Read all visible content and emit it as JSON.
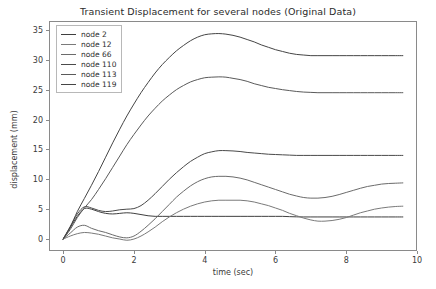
{
  "chart_data": {
    "type": "line",
    "title": "Transient Displacement for several nodes (Original Data)",
    "xlabel": "time (sec)",
    "ylabel": "displacement (mm)",
    "xlim": [
      -0.4,
      10.0
    ],
    "ylim": [
      -2.0,
      36.5
    ],
    "xticks": [
      0,
      2,
      4,
      6,
      8,
      10
    ],
    "xtick_labels": [
      "0",
      "2",
      "4",
      "6",
      "8",
      "10"
    ],
    "yticks": [
      0,
      5,
      10,
      15,
      20,
      25,
      30,
      35
    ],
    "ytick_labels": [
      "0",
      "5",
      "10",
      "15",
      "20",
      "25",
      "30",
      "35"
    ],
    "grid": false,
    "legend_position": "upper left",
    "x": [
      0,
      0.2,
      0.4,
      0.6,
      0.8,
      1.0,
      1.2,
      1.4,
      1.6,
      1.8,
      2.0,
      2.2,
      2.4,
      2.6,
      2.8,
      3.0,
      3.2,
      3.4,
      3.6,
      3.8,
      4.0,
      4.2,
      4.4,
      4.6,
      4.8,
      5.0,
      5.2,
      5.4,
      5.6,
      5.8,
      6.0,
      6.2,
      6.4,
      6.6,
      6.8,
      7.0,
      7.2,
      7.4,
      7.6,
      7.8,
      8.0,
      8.2,
      8.4,
      8.6,
      8.8,
      9.0,
      9.2,
      9.4,
      9.6
    ],
    "series": [
      {
        "name": "node 2",
        "color": "#3f3f3f",
        "values": [
          0.0,
          1.9,
          3.8,
          5.1,
          5.0,
          4.6,
          4.3,
          4.2,
          4.3,
          4.4,
          4.3,
          4.1,
          3.9,
          3.8,
          3.8,
          3.8,
          3.8,
          3.8,
          3.8,
          3.8,
          3.8,
          3.8,
          3.8,
          3.8,
          3.8,
          3.8,
          3.8,
          3.8,
          3.8,
          3.8,
          3.8,
          3.8,
          3.75,
          3.72,
          3.7,
          3.7,
          3.7,
          3.7,
          3.7,
          3.7,
          3.7,
          3.7,
          3.7,
          3.7,
          3.7,
          3.7,
          3.7,
          3.7,
          3.7
        ]
      },
      {
        "name": "node 12",
        "color": "#7a7a7a",
        "values": [
          0.0,
          0.5,
          0.9,
          1.1,
          1.0,
          0.8,
          0.5,
          0.2,
          0.0,
          -0.2,
          0.0,
          0.5,
          1.2,
          2.0,
          2.9,
          3.7,
          4.4,
          5.0,
          5.5,
          5.9,
          6.2,
          6.4,
          6.5,
          6.5,
          6.5,
          6.5,
          6.4,
          6.2,
          5.9,
          5.6,
          5.2,
          4.8,
          4.3,
          3.9,
          3.5,
          3.2,
          3.0,
          3.0,
          3.1,
          3.3,
          3.6,
          4.0,
          4.4,
          4.7,
          5.0,
          5.2,
          5.35,
          5.45,
          5.5
        ]
      },
      {
        "name": "node 66",
        "color": "#6b6b6b",
        "values": [
          0.0,
          1.0,
          2.0,
          2.3,
          1.8,
          1.4,
          1.1,
          0.7,
          0.35,
          0.2,
          0.5,
          1.3,
          2.3,
          3.4,
          4.6,
          5.8,
          7.0,
          8.0,
          8.9,
          9.6,
          10.1,
          10.4,
          10.5,
          10.5,
          10.4,
          10.2,
          9.9,
          9.5,
          9.1,
          8.7,
          8.3,
          7.9,
          7.5,
          7.2,
          6.95,
          6.85,
          6.85,
          6.95,
          7.15,
          7.45,
          7.8,
          8.15,
          8.5,
          8.8,
          9.0,
          9.2,
          9.3,
          9.35,
          9.4
        ]
      },
      {
        "name": "node 110",
        "color": "#4a4a4a",
        "values": [
          0.0,
          2.1,
          4.2,
          5.4,
          5.2,
          4.8,
          4.6,
          4.7,
          4.9,
          5.0,
          5.1,
          5.6,
          6.5,
          7.6,
          8.8,
          10.0,
          11.1,
          12.1,
          13.0,
          13.7,
          14.3,
          14.6,
          14.8,
          14.8,
          14.75,
          14.65,
          14.5,
          14.4,
          14.3,
          14.2,
          14.15,
          14.1,
          14.05,
          14.0,
          14.0,
          14.0,
          14.0,
          14.0,
          14.0,
          14.0,
          14.0,
          14.0,
          14.0,
          14.0,
          14.0,
          14.0,
          14.0,
          14.0,
          14.0
        ]
      },
      {
        "name": "node 113",
        "color": "#5a5a5a",
        "values": [
          0.0,
          1.6,
          3.6,
          5.2,
          6.6,
          8.3,
          10.1,
          12.0,
          13.9,
          15.8,
          17.5,
          19.1,
          20.6,
          21.9,
          23.1,
          24.1,
          25.0,
          25.7,
          26.3,
          26.7,
          27.0,
          27.1,
          27.15,
          27.1,
          26.9,
          26.7,
          26.4,
          26.0,
          25.7,
          25.4,
          25.2,
          25.0,
          24.85,
          24.7,
          24.6,
          24.55,
          24.5,
          24.5,
          24.5,
          24.5,
          24.5,
          24.5,
          24.5,
          24.5,
          24.5,
          24.5,
          24.5,
          24.5,
          24.5
        ]
      },
      {
        "name": "node 119",
        "color": "#454545",
        "values": [
          0.0,
          2.0,
          4.6,
          6.8,
          9.0,
          11.3,
          13.7,
          16.1,
          18.4,
          20.6,
          22.6,
          24.5,
          26.2,
          27.8,
          29.2,
          30.4,
          31.5,
          32.4,
          33.2,
          33.8,
          34.2,
          34.35,
          34.4,
          34.3,
          34.1,
          33.8,
          33.4,
          33.0,
          32.5,
          32.1,
          31.7,
          31.4,
          31.1,
          30.9,
          30.8,
          30.7,
          30.7,
          30.7,
          30.7,
          30.7,
          30.7,
          30.7,
          30.7,
          30.7,
          30.7,
          30.7,
          30.7,
          30.7,
          30.7
        ]
      }
    ]
  }
}
